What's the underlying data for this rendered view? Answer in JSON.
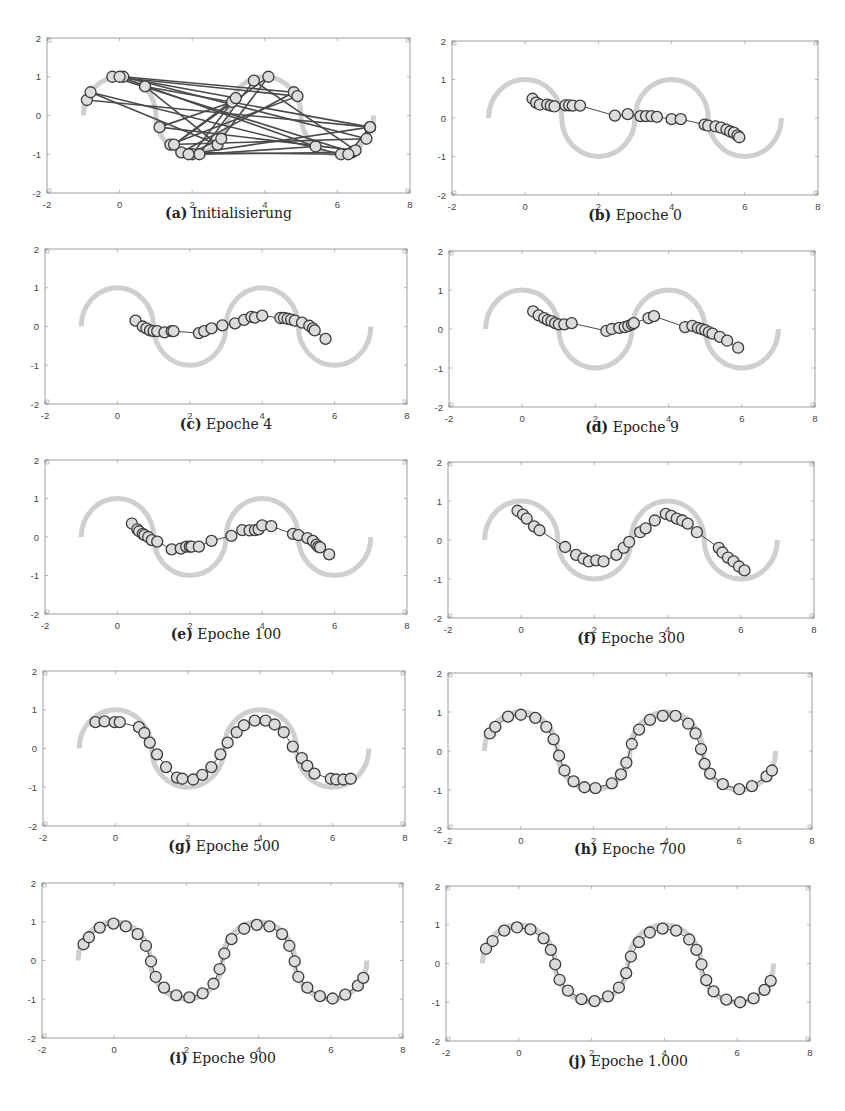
{
  "colors": {
    "target_curve": "#cfcfcf",
    "node_fill": "#dcdcdc",
    "node_stroke": "#3a3a3a",
    "edge": "#4a4a4a",
    "frame": "#888888",
    "tick_text": "#444444"
  },
  "axes": {
    "xlim": [
      -2,
      8
    ],
    "ylim": [
      -2,
      2
    ],
    "xticks": [
      "-2",
      "0",
      "2",
      "4",
      "6",
      "8"
    ],
    "yticks": [
      "2",
      "1",
      "0",
      "-1",
      "-2"
    ],
    "xtick_values": [
      -2,
      0,
      2,
      4,
      6,
      8
    ],
    "ytick_values": [
      2,
      1,
      0,
      -1,
      -2
    ]
  },
  "target_curve": {
    "description": "alternating semicircles of radius 1 centered on y=0 at x=0,2,4,6",
    "centers_x": [
      0,
      2,
      4,
      6
    ],
    "orientation": [
      "up",
      "down",
      "up",
      "down"
    ],
    "radius": 1
  },
  "chart_data": [
    {
      "type": "line",
      "panel_label": "(a)",
      "title": "Initialisierung",
      "connected_in_order": true,
      "points": [
        [
          -0.9,
          0.4
        ],
        [
          6.9,
          -0.3
        ],
        [
          0.7,
          0.75
        ],
        [
          2.7,
          -0.75
        ],
        [
          -0.8,
          0.6
        ],
        [
          6.1,
          -1.0
        ],
        [
          1.7,
          -0.95
        ],
        [
          4.8,
          0.6
        ],
        [
          0.1,
          1.0
        ],
        [
          6.8,
          -0.6
        ],
        [
          1.4,
          -0.75
        ],
        [
          4.9,
          0.5
        ],
        [
          -0.2,
          1.0
        ],
        [
          6.4,
          -0.95
        ],
        [
          2.0,
          -1.0
        ],
        [
          3.1,
          0.35
        ],
        [
          1.1,
          -0.3
        ],
        [
          6.5,
          -0.9
        ],
        [
          3.7,
          0.9
        ],
        [
          2.2,
          -1.0
        ],
        [
          5.4,
          -0.8
        ],
        [
          0.0,
          1.0
        ],
        [
          3.2,
          0.45
        ],
        [
          1.5,
          -0.75
        ],
        [
          4.1,
          1.0
        ],
        [
          2.8,
          -0.6
        ],
        [
          1.9,
          -1.0
        ],
        [
          6.9,
          -0.3
        ],
        [
          6.3,
          -1.0
        ]
      ]
    },
    {
      "type": "line",
      "panel_label": "(b)",
      "title": "Epoche 0",
      "connected_in_order": true,
      "points": [
        [
          0.2,
          0.5
        ],
        [
          0.3,
          0.4
        ],
        [
          0.4,
          0.35
        ],
        [
          0.6,
          0.35
        ],
        [
          0.7,
          0.32
        ],
        [
          0.8,
          0.3
        ],
        [
          1.1,
          0.33
        ],
        [
          1.2,
          0.33
        ],
        [
          1.3,
          0.32
        ],
        [
          1.5,
          0.32
        ],
        [
          2.45,
          0.06
        ],
        [
          2.8,
          0.1
        ],
        [
          3.15,
          0.05
        ],
        [
          3.3,
          0.05
        ],
        [
          3.45,
          0.05
        ],
        [
          3.6,
          0.03
        ],
        [
          4.0,
          -0.03
        ],
        [
          4.25,
          -0.03
        ],
        [
          4.9,
          -0.17
        ],
        [
          5.0,
          -0.2
        ],
        [
          5.2,
          -0.22
        ],
        [
          5.35,
          -0.25
        ],
        [
          5.5,
          -0.3
        ],
        [
          5.6,
          -0.35
        ],
        [
          5.7,
          -0.38
        ],
        [
          5.8,
          -0.45
        ],
        [
          5.85,
          -0.5
        ]
      ]
    },
    {
      "type": "line",
      "panel_label": "(c)",
      "title": "Epoche 4",
      "connected_in_order": true,
      "points": [
        [
          0.5,
          0.15
        ],
        [
          0.7,
          0.0
        ],
        [
          0.8,
          -0.05
        ],
        [
          0.9,
          -0.1
        ],
        [
          1.0,
          -0.12
        ],
        [
          1.1,
          -0.12
        ],
        [
          1.3,
          -0.15
        ],
        [
          1.5,
          -0.12
        ],
        [
          1.55,
          -0.12
        ],
        [
          2.25,
          -0.17
        ],
        [
          2.4,
          -0.12
        ],
        [
          2.6,
          -0.05
        ],
        [
          2.9,
          0.03
        ],
        [
          3.25,
          0.08
        ],
        [
          3.5,
          0.17
        ],
        [
          3.7,
          0.25
        ],
        [
          3.8,
          0.23
        ],
        [
          4.0,
          0.28
        ],
        [
          4.5,
          0.22
        ],
        [
          4.6,
          0.22
        ],
        [
          4.7,
          0.2
        ],
        [
          4.8,
          0.18
        ],
        [
          4.9,
          0.15
        ],
        [
          5.1,
          0.1
        ],
        [
          5.3,
          0.02
        ],
        [
          5.4,
          -0.05
        ],
        [
          5.45,
          -0.1
        ],
        [
          5.75,
          -0.32
        ]
      ]
    },
    {
      "type": "line",
      "panel_label": "(d)",
      "title": "Epoche 9",
      "connected_in_order": true,
      "points": [
        [
          0.3,
          0.45
        ],
        [
          0.45,
          0.35
        ],
        [
          0.6,
          0.28
        ],
        [
          0.7,
          0.23
        ],
        [
          0.8,
          0.2
        ],
        [
          0.9,
          0.15
        ],
        [
          1.0,
          0.12
        ],
        [
          1.15,
          0.12
        ],
        [
          1.35,
          0.15
        ],
        [
          2.3,
          -0.05
        ],
        [
          2.45,
          0.0
        ],
        [
          2.65,
          0.03
        ],
        [
          2.8,
          0.05
        ],
        [
          2.9,
          0.08
        ],
        [
          3.0,
          0.12
        ],
        [
          3.05,
          0.15
        ],
        [
          3.45,
          0.28
        ],
        [
          3.6,
          0.33
        ],
        [
          4.45,
          0.05
        ],
        [
          4.65,
          0.08
        ],
        [
          4.8,
          0.03
        ],
        [
          4.9,
          0.0
        ],
        [
          5.0,
          -0.03
        ],
        [
          5.1,
          -0.08
        ],
        [
          5.2,
          -0.12
        ],
        [
          5.4,
          -0.2
        ],
        [
          5.6,
          -0.3
        ],
        [
          5.9,
          -0.48
        ]
      ]
    },
    {
      "type": "line",
      "panel_label": "(e)",
      "title": "Epoche 100",
      "connected_in_order": true,
      "points": [
        [
          0.4,
          0.35
        ],
        [
          0.55,
          0.2
        ],
        [
          0.6,
          0.15
        ],
        [
          0.7,
          0.08
        ],
        [
          0.75,
          0.05
        ],
        [
          0.85,
          0.0
        ],
        [
          0.95,
          -0.08
        ],
        [
          1.1,
          -0.12
        ],
        [
          1.5,
          -0.32
        ],
        [
          1.75,
          -0.3
        ],
        [
          1.9,
          -0.25
        ],
        [
          2.0,
          -0.25
        ],
        [
          2.05,
          -0.25
        ],
        [
          2.25,
          -0.25
        ],
        [
          2.6,
          -0.1
        ],
        [
          3.15,
          0.03
        ],
        [
          3.45,
          0.18
        ],
        [
          3.65,
          0.17
        ],
        [
          3.8,
          0.18
        ],
        [
          3.9,
          0.2
        ],
        [
          4.0,
          0.3
        ],
        [
          4.25,
          0.28
        ],
        [
          4.85,
          0.08
        ],
        [
          5.0,
          0.05
        ],
        [
          5.25,
          -0.03
        ],
        [
          5.4,
          -0.1
        ],
        [
          5.5,
          -0.2
        ],
        [
          5.55,
          -0.25
        ],
        [
          5.6,
          -0.27
        ],
        [
          5.85,
          -0.45
        ]
      ]
    },
    {
      "type": "line",
      "panel_label": "(f)",
      "title": "Epoche 300",
      "connected_in_order": true,
      "points": [
        [
          -0.1,
          0.75
        ],
        [
          0.05,
          0.65
        ],
        [
          0.15,
          0.55
        ],
        [
          0.35,
          0.35
        ],
        [
          0.5,
          0.25
        ],
        [
          1.2,
          -0.18
        ],
        [
          1.5,
          -0.38
        ],
        [
          1.7,
          -0.48
        ],
        [
          1.85,
          -0.55
        ],
        [
          2.05,
          -0.52
        ],
        [
          2.25,
          -0.55
        ],
        [
          2.6,
          -0.38
        ],
        [
          2.8,
          -0.2
        ],
        [
          2.95,
          -0.05
        ],
        [
          3.25,
          0.2
        ],
        [
          3.4,
          0.3
        ],
        [
          3.65,
          0.5
        ],
        [
          3.95,
          0.67
        ],
        [
          4.1,
          0.62
        ],
        [
          4.25,
          0.55
        ],
        [
          4.4,
          0.5
        ],
        [
          4.55,
          0.42
        ],
        [
          4.8,
          0.2
        ],
        [
          5.4,
          -0.2
        ],
        [
          5.5,
          -0.32
        ],
        [
          5.65,
          -0.45
        ],
        [
          5.8,
          -0.55
        ],
        [
          5.95,
          -0.68
        ],
        [
          6.1,
          -0.78
        ]
      ]
    },
    {
      "type": "line",
      "panel_label": "(g)",
      "title": "Epoche 500",
      "connected_in_order": true,
      "points": [
        [
          -0.55,
          0.68
        ],
        [
          -0.3,
          0.7
        ],
        [
          -0.02,
          0.68
        ],
        [
          0.12,
          0.68
        ],
        [
          0.65,
          0.55
        ],
        [
          0.8,
          0.4
        ],
        [
          0.95,
          0.15
        ],
        [
          1.15,
          -0.15
        ],
        [
          1.4,
          -0.48
        ],
        [
          1.7,
          -0.75
        ],
        [
          1.85,
          -0.78
        ],
        [
          2.15,
          -0.8
        ],
        [
          2.4,
          -0.68
        ],
        [
          2.65,
          -0.48
        ],
        [
          2.9,
          -0.15
        ],
        [
          3.1,
          0.15
        ],
        [
          3.35,
          0.42
        ],
        [
          3.55,
          0.6
        ],
        [
          3.85,
          0.72
        ],
        [
          4.15,
          0.72
        ],
        [
          4.4,
          0.62
        ],
        [
          4.65,
          0.42
        ],
        [
          4.9,
          0.05
        ],
        [
          5.15,
          -0.25
        ],
        [
          5.3,
          -0.45
        ],
        [
          5.5,
          -0.65
        ],
        [
          5.95,
          -0.78
        ],
        [
          6.1,
          -0.8
        ],
        [
          6.3,
          -0.8
        ],
        [
          6.5,
          -0.78
        ]
      ]
    },
    {
      "type": "line",
      "panel_label": "(h)",
      "title": "Epoche 700",
      "connected_in_order": true,
      "points": [
        [
          -0.85,
          0.45
        ],
        [
          -0.7,
          0.62
        ],
        [
          -0.35,
          0.88
        ],
        [
          0.0,
          0.93
        ],
        [
          0.4,
          0.85
        ],
        [
          0.7,
          0.62
        ],
        [
          0.9,
          0.3
        ],
        [
          1.05,
          -0.12
        ],
        [
          1.2,
          -0.5
        ],
        [
          1.45,
          -0.78
        ],
        [
          1.75,
          -0.93
        ],
        [
          2.05,
          -0.95
        ],
        [
          2.5,
          -0.83
        ],
        [
          2.75,
          -0.6
        ],
        [
          2.9,
          -0.3
        ],
        [
          3.05,
          0.18
        ],
        [
          3.25,
          0.55
        ],
        [
          3.55,
          0.8
        ],
        [
          3.9,
          0.9
        ],
        [
          4.25,
          0.9
        ],
        [
          4.6,
          0.7
        ],
        [
          4.8,
          0.45
        ],
        [
          4.95,
          0.05
        ],
        [
          5.05,
          -0.33
        ],
        [
          5.2,
          -0.58
        ],
        [
          5.55,
          -0.85
        ],
        [
          6.0,
          -0.98
        ],
        [
          6.35,
          -0.9
        ],
        [
          6.75,
          -0.65
        ],
        [
          6.9,
          -0.5
        ]
      ]
    },
    {
      "type": "line",
      "panel_label": "(i)",
      "title": "Epoche 900",
      "connected_in_order": true,
      "points": [
        [
          -0.85,
          0.42
        ],
        [
          -0.7,
          0.6
        ],
        [
          -0.4,
          0.85
        ],
        [
          -0.02,
          0.95
        ],
        [
          0.32,
          0.88
        ],
        [
          0.65,
          0.68
        ],
        [
          0.88,
          0.38
        ],
        [
          1.02,
          -0.02
        ],
        [
          1.15,
          -0.42
        ],
        [
          1.38,
          -0.7
        ],
        [
          1.72,
          -0.9
        ],
        [
          2.08,
          -0.95
        ],
        [
          2.45,
          -0.85
        ],
        [
          2.75,
          -0.6
        ],
        [
          2.92,
          -0.22
        ],
        [
          3.05,
          0.18
        ],
        [
          3.25,
          0.55
        ],
        [
          3.6,
          0.82
        ],
        [
          3.95,
          0.92
        ],
        [
          4.3,
          0.88
        ],
        [
          4.65,
          0.68
        ],
        [
          4.85,
          0.38
        ],
        [
          5.0,
          -0.02
        ],
        [
          5.1,
          -0.42
        ],
        [
          5.35,
          -0.7
        ],
        [
          5.7,
          -0.92
        ],
        [
          6.05,
          -0.98
        ],
        [
          6.4,
          -0.88
        ],
        [
          6.75,
          -0.65
        ],
        [
          6.9,
          -0.45
        ]
      ]
    },
    {
      "type": "line",
      "panel_label": "(j)",
      "title": "Epoche 1.000",
      "connected_in_order": true,
      "points": [
        [
          -0.9,
          0.38
        ],
        [
          -0.72,
          0.58
        ],
        [
          -0.4,
          0.85
        ],
        [
          -0.05,
          0.93
        ],
        [
          0.32,
          0.88
        ],
        [
          0.68,
          0.65
        ],
        [
          0.88,
          0.35
        ],
        [
          1.0,
          -0.02
        ],
        [
          1.12,
          -0.42
        ],
        [
          1.35,
          -0.7
        ],
        [
          1.72,
          -0.92
        ],
        [
          2.08,
          -0.97
        ],
        [
          2.45,
          -0.85
        ],
        [
          2.75,
          -0.62
        ],
        [
          2.95,
          -0.25
        ],
        [
          3.08,
          0.18
        ],
        [
          3.3,
          0.55
        ],
        [
          3.6,
          0.8
        ],
        [
          3.95,
          0.9
        ],
        [
          4.32,
          0.85
        ],
        [
          4.68,
          0.62
        ],
        [
          4.88,
          0.35
        ],
        [
          5.02,
          -0.02
        ],
        [
          5.15,
          -0.43
        ],
        [
          5.35,
          -0.72
        ],
        [
          5.7,
          -0.93
        ],
        [
          6.08,
          -1.0
        ],
        [
          6.45,
          -0.9
        ],
        [
          6.75,
          -0.68
        ],
        [
          6.92,
          -0.45
        ]
      ]
    }
  ]
}
